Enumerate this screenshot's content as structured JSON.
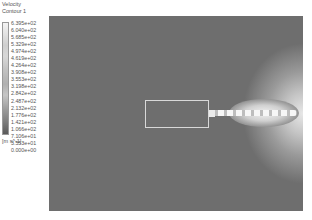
{
  "legend": {
    "title": "Velocity",
    "subtitle": "Contour 1",
    "ticks": [
      "6.395e+02",
      "6.040e+02",
      "5.685e+02",
      "5.329e+02",
      "4.974e+02",
      "4.619e+02",
      "4.264e+02",
      "3.908e+02",
      "3.553e+02",
      "3.198e+02",
      "2.842e+02",
      "2.487e+02",
      "2.132e+02",
      "1.776e+02",
      "1.421e+02",
      "1.066e+02",
      "7.106e+01",
      "3.553e+01",
      "0.000e+00"
    ],
    "units": "[m s^-1]"
  },
  "plot": {
    "field": "Velocity contour",
    "background_color": "#6e6e6e",
    "jet_color": "#f2f2f2"
  }
}
